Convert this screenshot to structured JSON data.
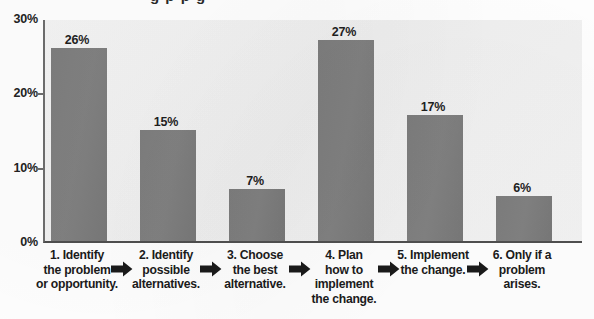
{
  "chart_data": {
    "type": "bar",
    "title": "",
    "xlabel": "",
    "ylabel": "",
    "ylim": [
      0,
      30
    ],
    "grid": false,
    "legend": "none",
    "categories": [
      "1. Identify the problem or opportunity.",
      "2. Identify possible alternatives.",
      "3. Choose the best alternative.",
      "4. Plan how to implement the change.",
      "5. Implement the change.",
      "6. Only if a problem arises."
    ],
    "values": [
      26,
      15,
      7,
      27,
      17,
      6
    ],
    "value_labels": [
      "26%",
      "15%",
      "7%",
      "27%",
      "17%",
      "6%"
    ],
    "y_ticks": [
      0,
      10,
      20,
      30
    ],
    "y_tick_labels": [
      "0%",
      "10%",
      "20%",
      "30%"
    ],
    "bar_color": "#7f7f7f",
    "plot_background": "#f2f2f2",
    "axis_color": "#5a5a5a"
  },
  "axis": {
    "y_labels": [
      "30%",
      "20%",
      "10%",
      "0%"
    ]
  },
  "categories": [
    {
      "index": "1",
      "lines": [
        "1. Identify",
        "the problem",
        "or opportunity."
      ],
      "value_label": "26%",
      "value": 26
    },
    {
      "index": "2",
      "lines": [
        "2. Identify",
        "possible",
        "alternatives."
      ],
      "value_label": "15%",
      "value": 15
    },
    {
      "index": "3",
      "lines": [
        "3. Choose",
        "the best",
        "alternative."
      ],
      "value_label": "7%",
      "value": 7
    },
    {
      "index": "4",
      "lines": [
        "4. Plan",
        "how to",
        "implement",
        "the change."
      ],
      "value_label": "27%",
      "value": 27
    },
    {
      "index": "5",
      "lines": [
        "5. Implement",
        "the change."
      ],
      "value_label": "17%",
      "value": 17
    },
    {
      "index": "6",
      "lines": [
        "6. Only if a",
        "problem",
        "arises."
      ],
      "value_label": "6%",
      "value": 6
    }
  ],
  "icons": {
    "arrow": "arrow-right-icon"
  }
}
